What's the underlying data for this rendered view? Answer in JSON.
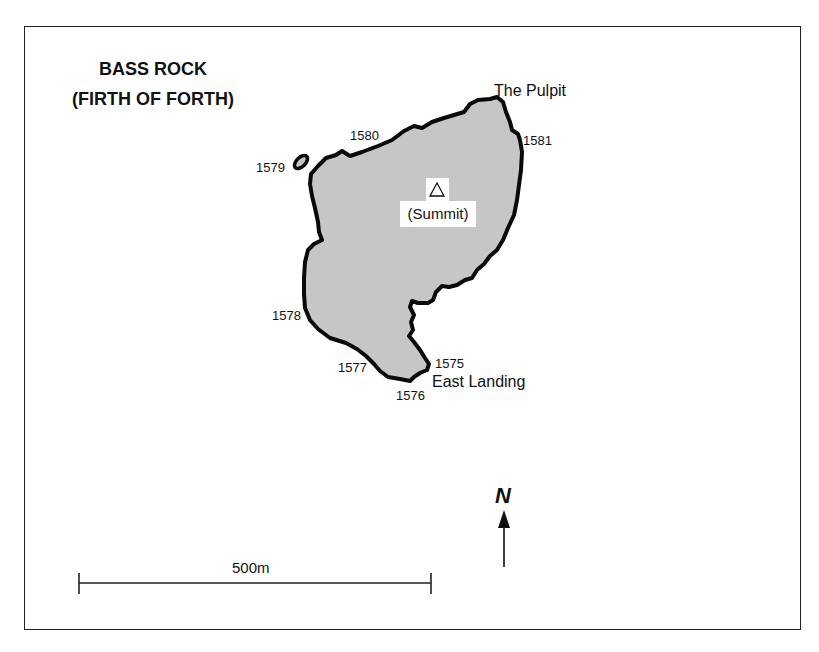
{
  "map": {
    "title_line1": "BASS ROCK",
    "title_line2": "(FIRTH OF FORTH)",
    "summit_label": "(Summit)",
    "summit_icon": "triangle-outline-icon",
    "landmarks": {
      "pulpit": "The Pulpit",
      "east_landing": "East Landing"
    },
    "point_labels": {
      "p1575": "1575",
      "p1576": "1576",
      "p1577": "1577",
      "p1578": "1578",
      "p1579": "1579",
      "p1580": "1580",
      "p1581": "1581"
    },
    "scale_bar": {
      "label": "500m"
    },
    "north_arrow": {
      "label": "N"
    },
    "colors": {
      "land_fill": "#c6c6c6",
      "coastline": "#0a0a0a",
      "background": "#ffffff"
    }
  }
}
